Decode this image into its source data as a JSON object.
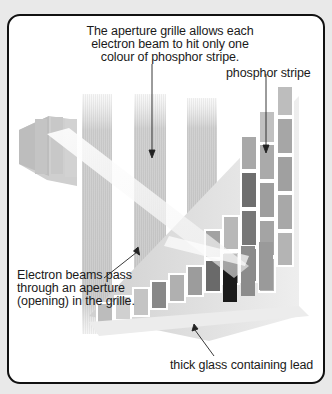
{
  "diagram": {
    "labels": {
      "aperture_line1": "The aperture grille allows each",
      "aperture_line2": "electron beam to hit only one",
      "aperture_line3": "colour of phosphor stripe.",
      "phosphor_stripe": "phosphor stripe",
      "beam_line1": "Electron beams pass",
      "beam_line2": "through an aperture",
      "beam_line3": "(opening) in the grille.",
      "glass": "thick glass containing lead"
    },
    "colors": {
      "background": "#e9e9e9",
      "frame_border": "#111111",
      "panel": "#ffffff",
      "grille": "#d4d4d4",
      "screen_dark": "#6a6a6a",
      "screen_mid": "#9a9a9a",
      "screen_light": "#bdbdbd"
    }
  }
}
